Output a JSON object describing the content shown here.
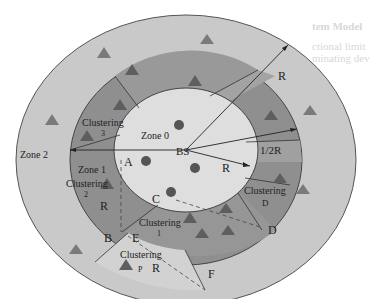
{
  "background_text": {
    "heading": "tem Model",
    "line1": "ctional limit",
    "line2": "minating dev"
  },
  "zones": {
    "zone0": "Zone 0",
    "zone1": "Zone 1",
    "zone2": "Zone 2"
  },
  "base_station": "BS",
  "clusters": {
    "c1_title": "Clustering",
    "c1_num": "1",
    "c2_title": "Clustering",
    "c2_num": "2",
    "c3_title": "Clustering",
    "c3_num": "3",
    "cD_title": "Clustering",
    "cD_num": "D",
    "cP_title": "Clustering",
    "cP_num": "P"
  },
  "points": {
    "A": "A",
    "B": "B",
    "C": "C",
    "D": "D",
    "E": "E",
    "F": "F"
  },
  "radii": {
    "r_outer": "R",
    "r_half": "1/2R",
    "r_inner": "R",
    "r_zone1": "R",
    "r_p": "R"
  },
  "colors": {
    "outer_ring": "#c9c9c9",
    "middle_ring": "#8f8f8f",
    "inner_zone": "#dedede",
    "triangle": "#6e6e6e",
    "node": "#555555"
  }
}
